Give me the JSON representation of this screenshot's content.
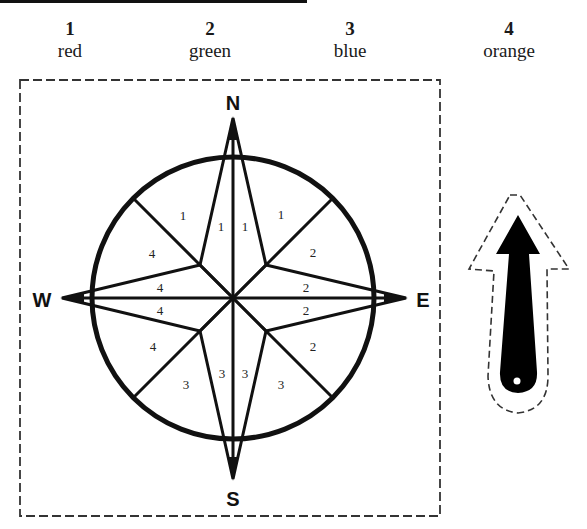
{
  "legend": [
    {
      "number": "1",
      "color_name": "red"
    },
    {
      "number": "2",
      "color_name": "green"
    },
    {
      "number": "3",
      "color_name": "blue"
    },
    {
      "number": "4",
      "color_name": "orange"
    }
  ],
  "compass": {
    "directions": {
      "north": "N",
      "east": "E",
      "south": "S",
      "west": "W"
    },
    "sector_labels": {
      "nw_outer": "1",
      "n_left": "1",
      "n_right": "1",
      "ne_outer": "1",
      "ne_lower": "2",
      "e_upper": "2",
      "e_lower": "2",
      "se_upper": "2",
      "se_outer": "3",
      "s_right": "3",
      "s_left": "3",
      "sw_outer": "3",
      "sw_upper": "4",
      "w_lower": "4",
      "w_upper": "4",
      "nw_lower": "4"
    }
  },
  "arrow": {
    "icon": "arrow-up-cutout",
    "fill_color": "#000000"
  },
  "colors": {
    "line": "#111111",
    "background": "#ffffff"
  }
}
